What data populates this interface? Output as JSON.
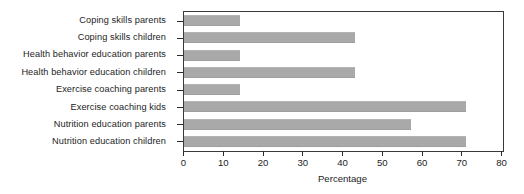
{
  "chart_data": {
    "type": "bar",
    "orientation": "horizontal",
    "title": "",
    "xlabel": "Percentage",
    "ylabel": "",
    "xlim": [
      0,
      80
    ],
    "xticks": [
      0,
      10,
      20,
      30,
      40,
      50,
      60,
      70,
      80
    ],
    "xtick_labels": [
      "0",
      "10",
      "20",
      "30",
      "40",
      "50",
      "60",
      "70",
      "80"
    ],
    "grid": false,
    "legend": false,
    "bar_color": "#a9a9a9",
    "frame_color": "#3a3a3a",
    "categories": [
      "Coping skills parents",
      "Coping skills children",
      "Health behavior education parents",
      "Health behavior education children",
      "Exercise coaching parents",
      "Exercise coaching kids",
      "Nutrition education parents",
      "Nutrition education children"
    ],
    "values": [
      14,
      43,
      14,
      43,
      14,
      71,
      57,
      71
    ],
    "series": [
      {
        "name": "Percentage",
        "values": [
          14,
          43,
          14,
          43,
          14,
          71,
          57,
          71
        ]
      }
    ]
  }
}
